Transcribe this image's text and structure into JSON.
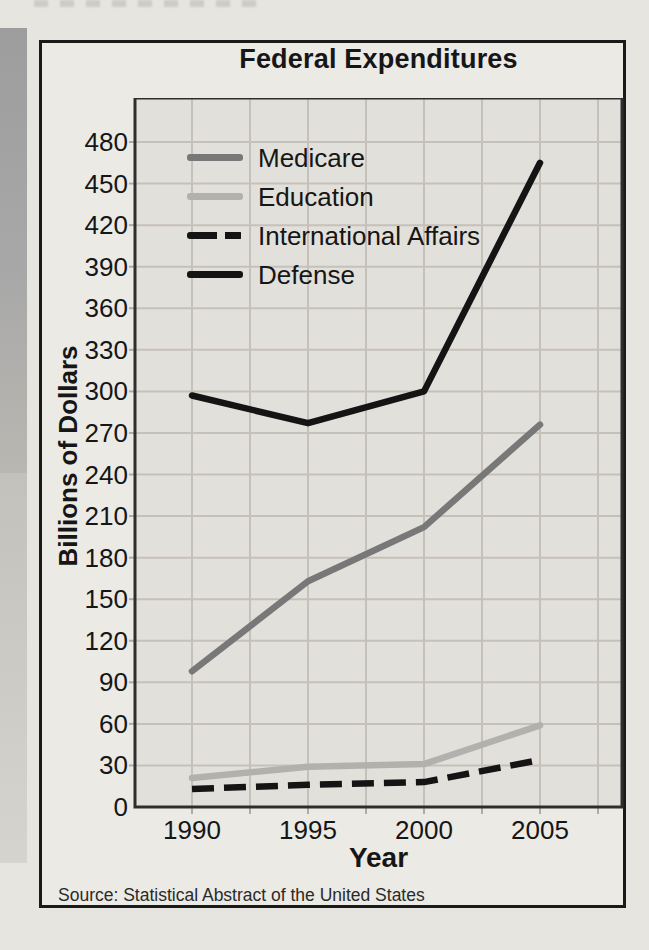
{
  "chart_data": {
    "type": "line",
    "title": "Federal Expenditures",
    "xlabel": "Year",
    "ylabel": "Billions of Dollars",
    "source": "Source: Statistical Abstract of the United States",
    "x": [
      1990,
      1995,
      2000,
      2005
    ],
    "xtick_labels": [
      "1990",
      "1995",
      "2000",
      "2005"
    ],
    "ytick_labels": [
      "0",
      "30",
      "60",
      "90",
      "120",
      "150",
      "180",
      "210",
      "240",
      "270",
      "300",
      "330",
      "360",
      "390",
      "420",
      "450",
      "480"
    ],
    "ylim": [
      0,
      480
    ],
    "ytick_step": 30,
    "grid": true,
    "legend_position": "top-left",
    "axis_color": "#2e2e2e",
    "gridline_color": "#c6c0ba",
    "plot_background": "#e2e0db",
    "series": [
      {
        "name": "Medicare",
        "color": "#787878",
        "style": "solid",
        "values": [
          98,
          163,
          202,
          276
        ]
      },
      {
        "name": "Education",
        "color": "#b2b1ad",
        "style": "solid",
        "values": [
          21,
          29,
          31,
          59
        ]
      },
      {
        "name": "International Affairs",
        "color": "#141414",
        "style": "dashed",
        "values": [
          13,
          16,
          18,
          34
        ]
      },
      {
        "name": "Defense",
        "color": "#141414",
        "style": "solid",
        "values": [
          297,
          277,
          300,
          465
        ]
      }
    ]
  }
}
